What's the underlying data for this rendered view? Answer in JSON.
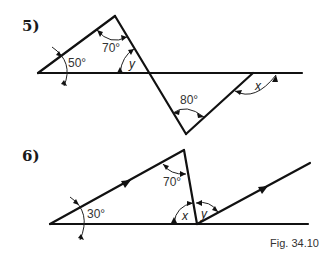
{
  "figure": {
    "caption": "Fig. 34.10",
    "problems": [
      {
        "label": "5)",
        "angles": {
          "left": "50°",
          "top": "70°",
          "unknown_y": "y",
          "bottom": "80°",
          "unknown_x": "x"
        }
      },
      {
        "label": "6)",
        "angles": {
          "left": "30°",
          "top": "70°",
          "unknown_x": "x",
          "unknown_y": "y"
        }
      }
    ]
  },
  "colors": {
    "line": "#111111",
    "text": "#333333",
    "background": "#ffffff"
  }
}
